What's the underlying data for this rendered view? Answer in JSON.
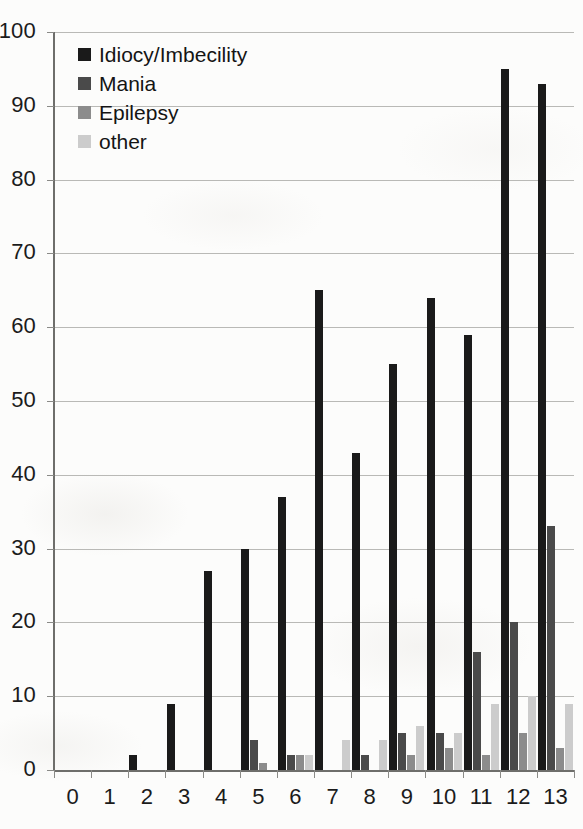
{
  "chart_data": {
    "type": "bar",
    "title": "",
    "subtitle": "",
    "xlabel": "",
    "ylabel": "",
    "xlim": [
      0,
      14
    ],
    "ylim": [
      0,
      100
    ],
    "ytick_step": 10,
    "yticks": [
      0,
      10,
      20,
      30,
      40,
      50,
      60,
      70,
      80,
      90,
      100
    ],
    "grid": true,
    "grid_axis": "y",
    "legend_position": "top-left",
    "categories": [
      "0",
      "1",
      "2",
      "3",
      "4",
      "5",
      "6",
      "7",
      "8",
      "9",
      "10",
      "11",
      "12",
      "13"
    ],
    "series": [
      {
        "name": "Idiocy/Imbecility",
        "color": "#1a1a1a",
        "values": [
          0,
          0,
          2,
          9,
          27,
          30,
          37,
          65,
          43,
          55,
          64,
          59,
          95,
          93
        ]
      },
      {
        "name": "Mania",
        "color": "#4a4a4a",
        "values": [
          0,
          0,
          0,
          0,
          0,
          4,
          2,
          0,
          2,
          5,
          5,
          16,
          20,
          33
        ]
      },
      {
        "name": "Epilepsy",
        "color": "#8c8c8c",
        "values": [
          0,
          0,
          0,
          0,
          0,
          1,
          2,
          0,
          0,
          2,
          3,
          2,
          5,
          3
        ]
      },
      {
        "name": "other",
        "color": "#cccccc",
        "values": [
          0,
          0,
          0,
          0,
          0,
          0,
          2,
          4,
          4,
          6,
          5,
          9,
          10,
          9
        ]
      }
    ]
  },
  "legend": {
    "items": [
      {
        "label": "Idiocy/Imbecility",
        "color": "#1a1a1a"
      },
      {
        "label": "Mania",
        "color": "#4a4a4a"
      },
      {
        "label": "Epilepsy",
        "color": "#8c8c8c"
      },
      {
        "label": "other",
        "color": "#cccccc"
      }
    ]
  }
}
